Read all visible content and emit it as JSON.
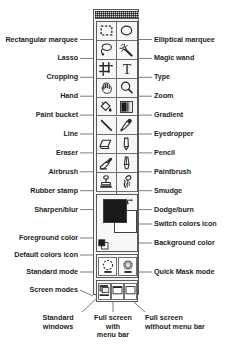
{
  "diagram": {
    "line_color": "#6d6e71",
    "text_color": "#231f20"
  },
  "tools": {
    "rows": [
      {
        "left": "Rectangular marquee",
        "right": "Elliptical marquee",
        "left_icon": "rectangular-marquee-icon",
        "right_icon": "elliptical-marquee-icon"
      },
      {
        "left": "Lasso",
        "right": "Magic wand",
        "left_icon": "lasso-icon",
        "right_icon": "magic-wand-icon"
      },
      {
        "left": "Cropping",
        "right": "Type",
        "left_icon": "crop-icon",
        "right_icon": "type-icon"
      },
      {
        "left": "Hand",
        "right": "Zoom",
        "left_icon": "hand-icon",
        "right_icon": "zoom-icon"
      },
      {
        "left": "Paint bucket",
        "right": "Gradient",
        "left_icon": "paint-bucket-icon",
        "right_icon": "gradient-icon"
      },
      {
        "left": "Line",
        "right": "Eyedropper",
        "left_icon": "line-icon",
        "right_icon": "eyedropper-icon"
      },
      {
        "left": "Eraser",
        "right": "Pencil",
        "left_icon": "eraser-icon",
        "right_icon": "pencil-icon"
      },
      {
        "left": "Airbrush",
        "right": "Paintbrush",
        "left_icon": "airbrush-icon",
        "right_icon": "paintbrush-icon"
      },
      {
        "left": "Rubber stamp",
        "right": "Smudge",
        "left_icon": "rubber-stamp-icon",
        "right_icon": "smudge-icon"
      },
      {
        "left": "Sharpen/blur",
        "right": "Dodge/burn",
        "left_icon": "sharpen-blur-icon",
        "right_icon": "dodge-burn-icon"
      }
    ]
  },
  "color_section": {
    "foreground_label": "Foreground color",
    "background_label": "Background color",
    "switch_label": "Switch colors icon",
    "default_label": "Default colors icon",
    "foreground_color": "#1a1a1a",
    "background_color": "#ffffff"
  },
  "mask_section": {
    "standard_label": "Standard mode",
    "quickmask_label": "Quick Mask mode"
  },
  "screen_section": {
    "label": "Screen modes",
    "callouts": [
      "Standard\nwindows",
      "Full screen\nwith\nmenu bar",
      "Full screen\nwithout menu bar"
    ],
    "callout_1_line1": "Standard",
    "callout_1_line2": "windows",
    "callout_2_line1": "Full screen",
    "callout_2_line2": "with",
    "callout_2_line3": "menu bar",
    "callout_3_line1": "Full screen",
    "callout_3_line2": "without menu bar"
  }
}
